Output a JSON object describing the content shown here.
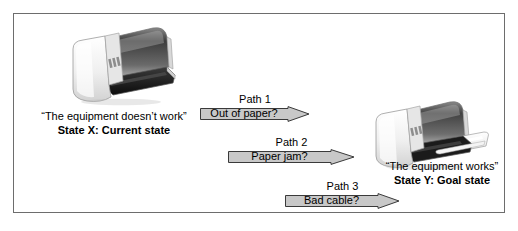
{
  "diagram": {
    "colors": {
      "frame_border": "#6d6d6d",
      "arrow_fill": "#c8c8c8",
      "arrow_border": "#3a3a3a",
      "text": "#000000",
      "background": "#ffffff",
      "printer_body": "#f2f2f2",
      "printer_top_dark": "#5a5a5a",
      "printer_tray_dark": "#1d1d1d",
      "paper_white": "#ffffff"
    },
    "states": {
      "left": {
        "quote": "“The equipment doesn’t work”",
        "state": "State X: Current state",
        "icon": "printer-broken-icon"
      },
      "right": {
        "quote": "“The equipment works”",
        "state": "State Y: Goal state",
        "icon": "printer-working-icon"
      }
    },
    "paths": [
      {
        "caption": "Path 1",
        "label": "Out of paper?"
      },
      {
        "caption": "Path 2",
        "label": "Paper jam?"
      },
      {
        "caption": "Path 3",
        "label": "Bad cable?"
      }
    ]
  }
}
